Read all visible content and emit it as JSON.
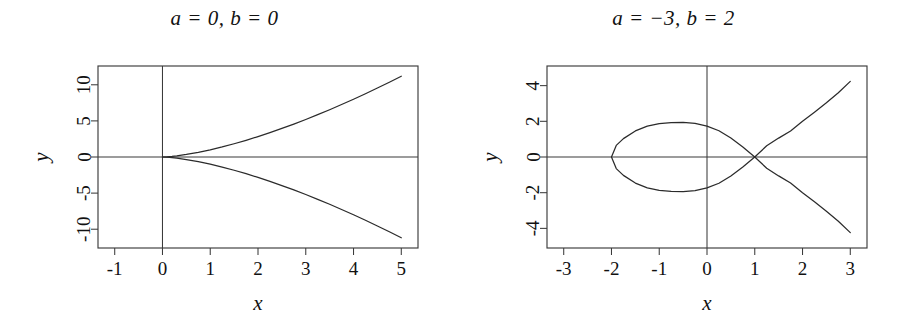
{
  "figure": {
    "background_color": "#ffffff",
    "line_color": "#2b2b2b",
    "axis_color": "#3b3b3b",
    "text_color": "#111111"
  },
  "panels": [
    {
      "id": "left",
      "title": "a = 0, b = 0",
      "xlabel": "x",
      "ylabel": "y"
    },
    {
      "id": "right",
      "title": "a = −3, b = 2",
      "xlabel": "x",
      "ylabel": "y"
    }
  ],
  "chart_data": [
    {
      "type": "line",
      "title": "a = 0, b = 0",
      "subtitle": "",
      "xlabel": "x",
      "ylabel": "y",
      "equation": "y^2 = x^3 + a x + b",
      "parameters": {
        "a": 0,
        "b": 0
      },
      "xlim": [
        -1.35,
        5.35
      ],
      "ylim": [
        -12.6,
        12.6
      ],
      "xticks": [
        -1,
        0,
        1,
        2,
        3,
        4,
        5
      ],
      "xticklabels": [
        "-1",
        "0",
        "1",
        "2",
        "3",
        "4",
        "5"
      ],
      "yticks": [
        -10,
        -5,
        0,
        5,
        10
      ],
      "yticklabels": [
        "-10",
        "-5",
        "0",
        "5",
        "10"
      ],
      "grid": false,
      "legend": "none",
      "axis_lines": {
        "x_axis_at_y": 0,
        "y_axis_at_x": 0
      },
      "features": [
        {
          "name": "cusp",
          "x": 0,
          "y": 0
        }
      ],
      "series": [
        {
          "name": "upper branch y = +sqrt(x^3)",
          "x": [
            0,
            0.1,
            0.2,
            0.3,
            0.4,
            0.5,
            0.75,
            1,
            1.25,
            1.5,
            1.75,
            2,
            2.25,
            2.5,
            2.75,
            3,
            3.25,
            3.5,
            3.75,
            4,
            4.25,
            4.5,
            4.75,
            5
          ],
          "y": [
            0,
            0.032,
            0.089,
            0.164,
            0.253,
            0.354,
            0.65,
            1,
            1.398,
            1.837,
            2.315,
            2.828,
            3.375,
            3.953,
            4.56,
            5.196,
            5.859,
            6.548,
            7.262,
            8,
            8.762,
            9.546,
            10.353,
            11.18
          ]
        },
        {
          "name": "lower branch y = -sqrt(x^3)",
          "x": [
            0,
            0.1,
            0.2,
            0.3,
            0.4,
            0.5,
            0.75,
            1,
            1.25,
            1.5,
            1.75,
            2,
            2.25,
            2.5,
            2.75,
            3,
            3.25,
            3.5,
            3.75,
            4,
            4.25,
            4.5,
            4.75,
            5
          ],
          "y": [
            0,
            -0.032,
            -0.089,
            -0.164,
            -0.253,
            -0.354,
            -0.65,
            -1,
            -1.398,
            -1.837,
            -2.315,
            -2.828,
            -3.375,
            -3.953,
            -4.56,
            -5.196,
            -5.859,
            -6.548,
            -7.262,
            -8,
            -8.762,
            -9.546,
            -10.353,
            -11.18
          ]
        }
      ]
    },
    {
      "type": "line",
      "title": "a = −3, b = 2",
      "subtitle": "",
      "xlabel": "x",
      "ylabel": "y",
      "equation": "y^2 = x^3 + a x + b",
      "parameters": {
        "a": -3,
        "b": 2
      },
      "xlim": [
        -3.35,
        3.35
      ],
      "ylim": [
        -5.1,
        5.1
      ],
      "xticks": [
        -3,
        -2,
        -1,
        0,
        1,
        2,
        3
      ],
      "xticklabels": [
        "-3",
        "-2",
        "-1",
        "0",
        "1",
        "2",
        "3"
      ],
      "yticks": [
        -4,
        -2,
        0,
        2,
        4
      ],
      "yticklabels": [
        "-4",
        "-2",
        "0",
        "2",
        "4"
      ],
      "grid": false,
      "legend": "none",
      "axis_lines": {
        "x_axis_at_y": 0,
        "y_axis_at_x": 0
      },
      "features": [
        {
          "name": "node",
          "x": 1,
          "y": 0
        },
        {
          "name": "loop-left-end",
          "x": -2,
          "y": 0
        },
        {
          "name": "loop-top",
          "x": -1,
          "y": 2
        },
        {
          "name": "loop-bottom",
          "x": -1,
          "y": -2
        }
      ],
      "series": [
        {
          "name": "upper branch y = +sqrt(x^3-3x+2)",
          "x": [
            -2,
            -1.9,
            -1.75,
            -1.5,
            -1.25,
            -1,
            -0.75,
            -0.5,
            -0.25,
            0,
            0.25,
            0.5,
            0.75,
            1,
            1.25,
            1.5,
            1.75,
            2,
            2.25,
            2.5,
            2.75,
            3
          ],
          "y": [
            0,
            0.65,
            1.03,
            1.46,
            1.73,
            1.87,
            1.93,
            1.94,
            1.89,
            1.73,
            1.47,
            1.06,
            0.56,
            0,
            0.63,
            1.06,
            1.46,
            2.0,
            2.51,
            3.04,
            3.6,
            4.24
          ]
        },
        {
          "name": "lower branch y = -sqrt(x^3-3x+2)",
          "x": [
            -2,
            -1.9,
            -1.75,
            -1.5,
            -1.25,
            -1,
            -0.75,
            -0.5,
            -0.25,
            0,
            0.25,
            0.5,
            0.75,
            1,
            1.25,
            1.5,
            1.75,
            2,
            2.25,
            2.5,
            2.75,
            3
          ],
          "y": [
            0,
            -0.65,
            -1.03,
            -1.46,
            -1.73,
            -1.87,
            -1.93,
            -1.94,
            -1.89,
            -1.73,
            -1.47,
            -1.06,
            -0.56,
            0,
            -0.63,
            -1.06,
            -1.46,
            -2.0,
            -2.51,
            -3.04,
            -3.6,
            -4.24
          ]
        }
      ]
    }
  ]
}
